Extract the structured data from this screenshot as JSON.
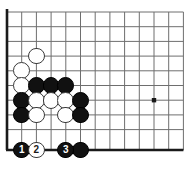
{
  "board": {
    "title": "Go board corner diagram",
    "background_color": "#ffffff",
    "line_color": "#6e6e6e",
    "edge_color": "#1a1a1a",
    "black_color": "#111111",
    "white_color": "#ffffff",
    "geometry": {
      "left": 7,
      "top": 12,
      "bottom": 150,
      "spacing": 14.7,
      "cols": 13,
      "rows": 10,
      "stone_radius": 8.4
    },
    "star_points": [
      {
        "name": "hoshi-4-4",
        "col": 10,
        "row": 6
      }
    ],
    "stones": [
      {
        "name": "white-stone-c2-r3",
        "color": "white",
        "col": 2,
        "row": 3,
        "label": ""
      },
      {
        "name": "white-stone-c1-r4",
        "color": "white",
        "col": 1,
        "row": 4,
        "label": ""
      },
      {
        "name": "white-stone-c1-r5",
        "color": "white",
        "col": 1,
        "row": 5,
        "label": ""
      },
      {
        "name": "black-stone-c2-r5",
        "color": "black",
        "col": 2,
        "row": 5,
        "label": ""
      },
      {
        "name": "black-stone-c3-r5",
        "color": "black",
        "col": 3,
        "row": 5,
        "label": ""
      },
      {
        "name": "black-stone-c4-r5",
        "color": "black",
        "col": 4,
        "row": 5,
        "label": ""
      },
      {
        "name": "black-stone-c1-r6",
        "color": "black",
        "col": 1,
        "row": 6,
        "label": ""
      },
      {
        "name": "white-stone-c2-r6",
        "color": "white",
        "col": 2,
        "row": 6,
        "label": ""
      },
      {
        "name": "white-stone-c3-r6",
        "color": "white",
        "col": 3,
        "row": 6,
        "label": ""
      },
      {
        "name": "white-stone-c4-r6",
        "color": "white",
        "col": 4,
        "row": 6,
        "label": ""
      },
      {
        "name": "black-stone-c5-r6",
        "color": "black",
        "col": 5,
        "row": 6,
        "label": ""
      },
      {
        "name": "black-stone-c1-r7",
        "color": "black",
        "col": 1,
        "row": 7,
        "label": ""
      },
      {
        "name": "white-stone-c2-r7",
        "color": "white",
        "col": 2,
        "row": 7,
        "label": ""
      },
      {
        "name": "white-stone-c4-r7",
        "color": "white",
        "col": 4,
        "row": 7,
        "label": ""
      },
      {
        "name": "black-stone-c5-r7",
        "color": "black",
        "col": 5,
        "row": 7,
        "label": ""
      },
      {
        "name": "black-stone-move-1",
        "color": "black",
        "col": 1,
        "row": 9,
        "label": "1"
      },
      {
        "name": "white-stone-move-2",
        "color": "white",
        "col": 2,
        "row": 9,
        "label": "2"
      },
      {
        "name": "black-stone-move-3",
        "color": "black",
        "col": 4,
        "row": 9,
        "label": "3"
      },
      {
        "name": "black-stone-c5-r9",
        "color": "black",
        "col": 5,
        "row": 9,
        "label": ""
      }
    ],
    "move_numbers": [
      "1",
      "2",
      "3"
    ]
  }
}
